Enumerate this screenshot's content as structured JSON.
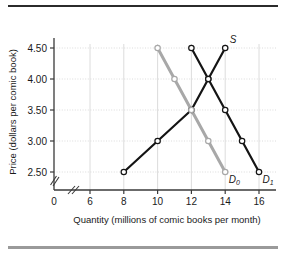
{
  "chart_data": {
    "type": "line",
    "title": "",
    "xlabel": "Quantity (millions of comic books per month)",
    "ylabel": "Price (dollars per comic book)",
    "xlim": [
      5,
      17
    ],
    "ylim": [
      2.25,
      4.75
    ],
    "xticks": [
      "0",
      "6",
      "8",
      "10",
      "12",
      "14",
      "16"
    ],
    "yticks": [
      "2.50",
      "3.00",
      "3.50",
      "4.00",
      "4.50"
    ],
    "grid": true,
    "axis_break_x": true,
    "axis_break_y": true,
    "legend": "inline-labels",
    "series": [
      {
        "name": "S",
        "label": "S",
        "sublabel": "",
        "color": "#141414",
        "points": [
          {
            "x": 8,
            "y": 2.5
          },
          {
            "x": 10,
            "y": 3.0
          },
          {
            "x": 12,
            "y": 3.5
          },
          {
            "x": 13,
            "y": 4.0
          },
          {
            "x": 14,
            "y": 4.5
          }
        ]
      },
      {
        "name": "D0",
        "label": "D",
        "sublabel": "0",
        "color": "#a8a8a8",
        "points": [
          {
            "x": 10,
            "y": 4.5
          },
          {
            "x": 11,
            "y": 4.0
          },
          {
            "x": 12,
            "y": 3.5
          },
          {
            "x": 13,
            "y": 3.0
          },
          {
            "x": 14,
            "y": 2.5
          }
        ]
      },
      {
        "name": "D1",
        "label": "D",
        "sublabel": "1",
        "color": "#141414",
        "points": [
          {
            "x": 12,
            "y": 4.5
          },
          {
            "x": 13,
            "y": 4.0
          },
          {
            "x": 14,
            "y": 3.5
          },
          {
            "x": 15,
            "y": 3.0
          },
          {
            "x": 16,
            "y": 2.5
          }
        ]
      }
    ],
    "colors": {
      "axis": "#3a3a3a",
      "grid": "#d8d8d8",
      "supply": "#141414",
      "demand0": "#a8a8a8",
      "demand1": "#141414",
      "rule_top": "#2b2b2b",
      "rule_bottom": "#9a9a9a"
    }
  },
  "labels": {
    "origin": "0"
  }
}
